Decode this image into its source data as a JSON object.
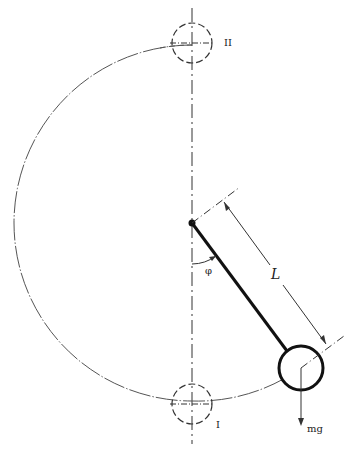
{
  "diagram": {
    "type": "pendulum-rotation",
    "labels": {
      "top_position": "II",
      "bottom_position": "I",
      "angle": "φ",
      "length": "L",
      "force": "mg"
    },
    "geometry": {
      "pivot": [
        192,
        223
      ],
      "path_radius": 178,
      "bob_center": [
        301,
        368
      ],
      "bob_radius": 22
    },
    "colors": {
      "line": "#222222",
      "path": "#555555"
    }
  }
}
